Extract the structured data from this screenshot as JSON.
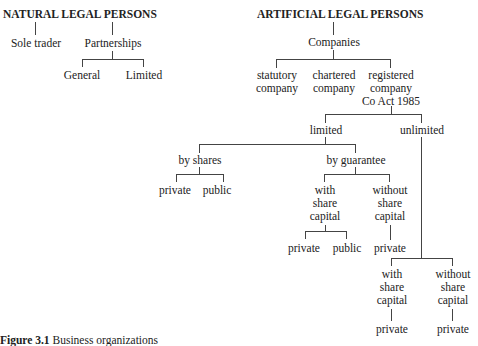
{
  "natural": {
    "title": "NATURAL LEGAL PERSONS",
    "sole_trader": "Sole trader",
    "partnerships": "Partnerships",
    "general": "General",
    "limited": "Limited"
  },
  "artificial": {
    "title": "ARTIFICIAL LEGAL PERSONS",
    "companies": "Companies",
    "statutory": [
      "statutory",
      "company"
    ],
    "chartered": [
      "chartered",
      "company"
    ],
    "registered": [
      "registered",
      "company",
      "Co Act 1985"
    ],
    "limited": "limited",
    "unlimited": "unlimited",
    "by_shares": "by shares",
    "by_guarantee": "by guarantee",
    "shares_private": "private",
    "shares_public": "public",
    "guar_with": [
      "with",
      "share",
      "capital"
    ],
    "guar_without": [
      "without",
      "share",
      "capital"
    ],
    "guar_with_private": "private",
    "guar_with_public": "public",
    "guar_without_private": "private",
    "unl_with": [
      "with",
      "share",
      "capital"
    ],
    "unl_without": [
      "without",
      "share",
      "capital"
    ],
    "unl_with_private": "private",
    "unl_without_private": "private"
  },
  "caption": {
    "label": "Figure 3.1",
    "text": "Business organizations"
  }
}
